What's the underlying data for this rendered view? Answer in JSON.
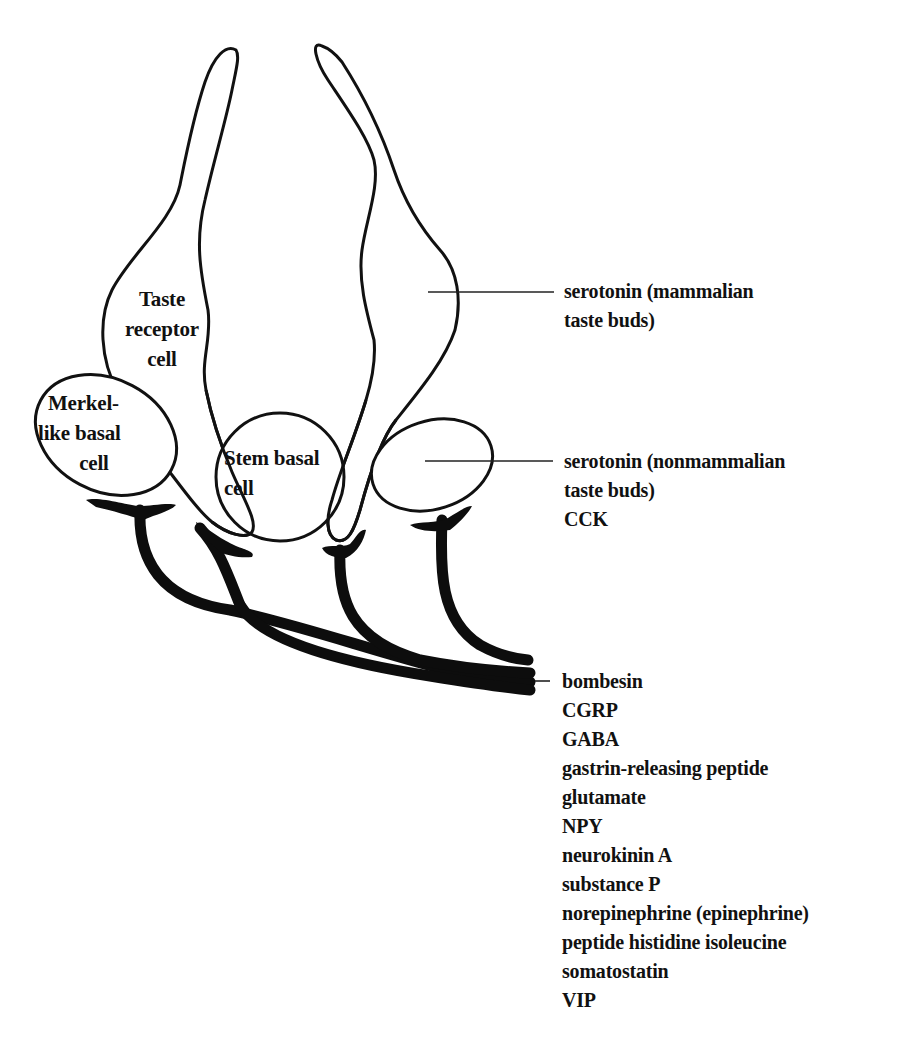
{
  "figure": {
    "colors": {
      "ink": "#111111",
      "background": "#ffffff"
    }
  },
  "cells": {
    "taste_receptor": {
      "lines": [
        "Taste",
        "receptor",
        "cell"
      ]
    },
    "merkel_like_basal": {
      "lines": [
        "Merkel-",
        "like basal",
        "cell"
      ]
    },
    "stem_basal": {
      "lines": [
        "Stem basal",
        "cell"
      ]
    },
    "elongated_cell": {
      "lines": []
    },
    "oval_basal_cell": {
      "lines": []
    }
  },
  "labels": {
    "mammalian_group": [
      "serotonin (mammalian",
      "taste buds)"
    ],
    "nonmammalian_group": [
      "serotonin (nonmammalian",
      "taste buds)",
      "CCK"
    ],
    "nerve_group": [
      "bombesin",
      "CGRP",
      "GABA",
      "gastrin-releasing peptide",
      "glutamate",
      "NPY",
      "neurokinin A",
      "substance P",
      "norepinephrine (epinephrine)",
      "peptide histidine isoleucine",
      "somatostatin",
      "VIP"
    ]
  }
}
